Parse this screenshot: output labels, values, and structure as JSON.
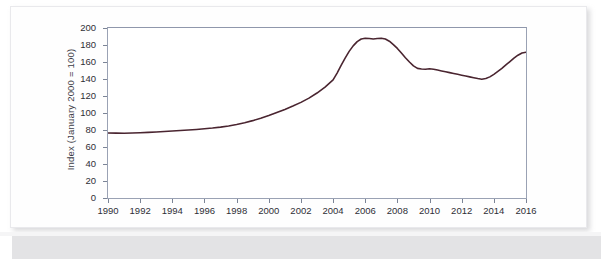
{
  "chart_data": {
    "type": "line",
    "title": "",
    "xlabel": "",
    "ylabel": "Index (January 2000 = 100)",
    "xlim": [
      1990,
      2016
    ],
    "ylim": [
      0,
      200
    ],
    "grid": false,
    "legend": null,
    "line_color": "#4a2530",
    "axis_color": "#9aa2b4",
    "background": "#ffffff",
    "yticks": [
      200,
      180,
      160,
      140,
      120,
      100,
      80,
      60,
      40,
      20,
      0
    ],
    "xticks": [
      1990,
      1992,
      1994,
      1996,
      1998,
      2000,
      2002,
      2004,
      2006,
      2008,
      2010,
      2012,
      2014,
      2016
    ],
    "series": [
      {
        "name": "Index (January 2000 = 100)",
        "x": [
          1990,
          1990.5,
          1991,
          1991.5,
          1992,
          1992.5,
          1993,
          1993.5,
          1994,
          1994.5,
          1995,
          1995.5,
          1996,
          1996.5,
          1997,
          1997.5,
          1998,
          1998.5,
          1999,
          1999.5,
          2000,
          2000.5,
          2001,
          2001.5,
          2002,
          2002.5,
          2003,
          2003.5,
          2004,
          2004.25,
          2004.5,
          2004.75,
          2005,
          2005.25,
          2005.5,
          2005.75,
          2006,
          2006.25,
          2006.5,
          2006.75,
          2007,
          2007.25,
          2007.5,
          2007.75,
          2008,
          2008.25,
          2008.5,
          2008.75,
          2009,
          2009.25,
          2009.5,
          2009.75,
          2010,
          2010.25,
          2010.5,
          2010.75,
          2011,
          2011.25,
          2011.5,
          2011.75,
          2012,
          2012.25,
          2012.5,
          2012.75,
          2013,
          2013.25,
          2013.5,
          2013.75,
          2014,
          2014.25,
          2014.5,
          2014.75,
          2015,
          2015.25,
          2015.5,
          2015.75,
          2016
        ],
        "values": [
          76.5,
          76.3,
          76.2,
          76.4,
          76.8,
          77.2,
          77.6,
          78.2,
          78.8,
          79.4,
          80.0,
          80.6,
          81.4,
          82.3,
          83.4,
          84.8,
          86.5,
          88.6,
          91.0,
          93.8,
          97.0,
          100.5,
          104.2,
          108.2,
          112.5,
          117.5,
          123.5,
          130.5,
          139.0,
          147.0,
          156.0,
          164.5,
          172.5,
          179.0,
          184.0,
          187.0,
          188.0,
          187.6,
          187.0,
          187.6,
          188.0,
          187.0,
          184.5,
          180.5,
          176.0,
          170.5,
          165.0,
          160.0,
          155.5,
          152.5,
          151.8,
          151.5,
          152.0,
          151.5,
          150.5,
          149.5,
          148.5,
          147.5,
          146.5,
          145.5,
          144.5,
          143.5,
          142.5,
          141.5,
          140.5,
          139.8,
          140.5,
          142.5,
          145.5,
          149.0,
          152.5,
          156.5,
          160.5,
          164.5,
          168.0,
          170.5,
          171.5
        ]
      }
    ],
    "annotations": []
  },
  "axis": {
    "y_title": "Index (January 2000 = 100)",
    "y_tick_labels": [
      "200",
      "180",
      "160",
      "140",
      "120",
      "100",
      "80",
      "60",
      "40",
      "20",
      "0"
    ],
    "x_tick_labels": [
      "1990",
      "1992",
      "1994",
      "1996",
      "1998",
      "2000",
      "2002",
      "2004",
      "2006",
      "2008",
      "2010",
      "2012",
      "2014",
      "2016"
    ]
  }
}
